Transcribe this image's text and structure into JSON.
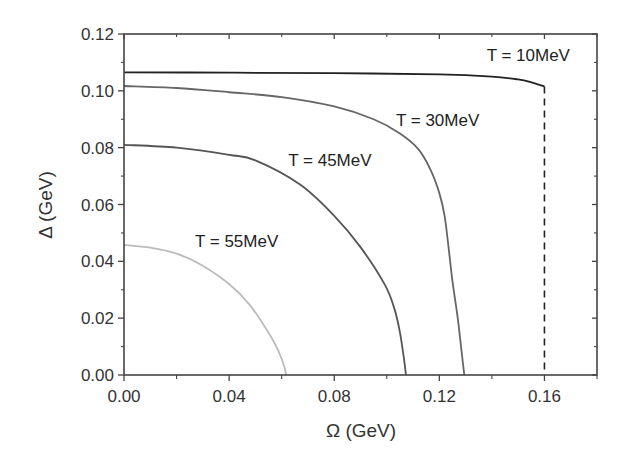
{
  "chart_data": {
    "type": "line",
    "title": "",
    "xlabel": "Ω (GeV)",
    "ylabel": "Δ (GeV)",
    "xlim": [
      0.0,
      0.18
    ],
    "ylim": [
      0.0,
      0.12
    ],
    "x_ticks": [
      0.0,
      0.04,
      0.08,
      0.12,
      0.16
    ],
    "x_tick_labels": [
      "0.00",
      "0.04",
      "0.08",
      "0.12",
      "0.16"
    ],
    "x_minor_ticks": [
      0.02,
      0.06,
      0.1,
      0.14,
      0.18
    ],
    "y_ticks": [
      0.0,
      0.02,
      0.04,
      0.06,
      0.08,
      0.1,
      0.12
    ],
    "y_tick_labels": [
      "0.00",
      "0.02",
      "0.04",
      "0.06",
      "0.08",
      "0.10",
      "0.12"
    ],
    "y_minor_ticks": [
      0.01,
      0.03,
      0.05,
      0.07,
      0.09,
      0.11
    ],
    "grid": false,
    "legend": "none (inline curve labels)",
    "series": [
      {
        "name": "T = 10MeV",
        "color": "#222222",
        "x": [
          0.0,
          0.04,
          0.08,
          0.12,
          0.14,
          0.15,
          0.155,
          0.16
        ],
        "y": [
          0.1065,
          0.1064,
          0.1062,
          0.1058,
          0.105,
          0.104,
          0.103,
          0.1015
        ]
      },
      {
        "name": "T = 10MeV drop",
        "style": "dashed",
        "color": "#222222",
        "x": [
          0.16,
          0.16
        ],
        "y": [
          0.1015,
          0.0
        ]
      },
      {
        "name": "T = 30MeV",
        "color": "#666666",
        "x": [
          0.0,
          0.02,
          0.04,
          0.06,
          0.08,
          0.095,
          0.105,
          0.112,
          0.1165,
          0.12,
          0.122,
          0.1235,
          0.125,
          0.127,
          0.1285,
          0.1295
        ],
        "y": [
          0.1017,
          0.101,
          0.0995,
          0.0978,
          0.0945,
          0.09,
          0.085,
          0.0795,
          0.0725,
          0.064,
          0.056,
          0.045,
          0.033,
          0.02,
          0.008,
          0.0
        ]
      },
      {
        "name": "T = 45MeV",
        "color": "#555555",
        "x": [
          0.0,
          0.02,
          0.04,
          0.05,
          0.067,
          0.08,
          0.09,
          0.0993,
          0.103,
          0.105,
          0.1065,
          0.1073
        ],
        "y": [
          0.081,
          0.08,
          0.0775,
          0.0755,
          0.067,
          0.056,
          0.045,
          0.0317,
          0.023,
          0.015,
          0.006,
          0.0
        ]
      },
      {
        "name": "T = 55MeV",
        "color": "#bbbbbb",
        "x": [
          0.0,
          0.01,
          0.02,
          0.029,
          0.04,
          0.048,
          0.0556,
          0.059,
          0.061,
          0.0617
        ],
        "y": [
          0.0458,
          0.0448,
          0.0427,
          0.039,
          0.032,
          0.0245,
          0.014,
          0.008,
          0.003,
          0.0
        ]
      }
    ],
    "annotations": [
      {
        "text": "T = 10MeV",
        "x": 0.138,
        "y": 0.1105
      },
      {
        "text": "T = 30MeV",
        "x": 0.1035,
        "y": 0.0875
      },
      {
        "text": "T = 45MeV",
        "x": 0.0625,
        "y": 0.0735
      },
      {
        "text": "T = 55MeV",
        "x": 0.027,
        "y": 0.045
      }
    ]
  }
}
